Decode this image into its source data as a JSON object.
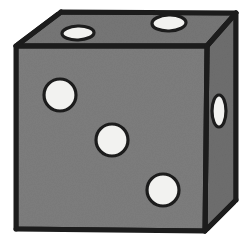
{
  "image": {
    "title": "Six-sided die shown in three-quarter perspective",
    "subject": "dice",
    "background_color": "#ffffff",
    "width": 246,
    "height": 246
  },
  "colors": {
    "outline": "#1c1c1c",
    "front_face_fill": "#7d7d7d",
    "top_face_fill": "#767676",
    "right_face_fill": "#6e6e6e",
    "pip_fill": "#f2f2f0",
    "pip_outline": "#1c1c1c"
  },
  "cube": {
    "faces": [
      {
        "name": "front-face",
        "label": "Front face",
        "pip_count": 3,
        "fill": "#7d7d7d",
        "polygon": "16,46 207,46 205,231 16,229"
      },
      {
        "name": "top-face",
        "label": "Top face",
        "pip_count": 2,
        "fill": "#767676",
        "polygon": "16,46 61,12 236,13 207,46"
      },
      {
        "name": "right-face",
        "label": "Right face",
        "pip_count": 1,
        "fill": "#6e6e6e",
        "polygon": "207,46 236,13 236,200 205,231"
      }
    ],
    "edges": [
      {
        "name": "edge-front-top",
        "from": "16,46",
        "to": "207,46"
      },
      {
        "name": "edge-front-right",
        "from": "207,46",
        "to": "205,231"
      },
      {
        "name": "edge-top-left",
        "from": "16,46",
        "to": "61,12"
      },
      {
        "name": "edge-top-back",
        "from": "61,12",
        "to": "236,13"
      },
      {
        "name": "edge-top-right",
        "from": "236,13",
        "to": "207,46"
      },
      {
        "name": "edge-right-back",
        "from": "236,13",
        "to": "236,200"
      },
      {
        "name": "edge-right-bottom",
        "from": "236,200",
        "to": "205,231"
      },
      {
        "name": "edge-front-bottom",
        "from": "16,229",
        "to": "205,231"
      },
      {
        "name": "edge-front-left",
        "from": "16,46",
        "to": "16,229"
      }
    ],
    "pips": [
      {
        "name": "pip-front-top-left",
        "face": "front-face",
        "cx": 60,
        "cy": 95,
        "rx": 16,
        "ry": 16,
        "rotate": 0
      },
      {
        "name": "pip-front-center",
        "face": "front-face",
        "cx": 112,
        "cy": 140,
        "rx": 16,
        "ry": 16,
        "rotate": 0
      },
      {
        "name": "pip-front-bottom-right",
        "face": "front-face",
        "cx": 163,
        "cy": 190,
        "rx": 16,
        "ry": 16,
        "rotate": 0
      },
      {
        "name": "pip-top-left",
        "face": "top-face",
        "cx": 78,
        "cy": 33,
        "rx": 16,
        "ry": 7,
        "rotate": -2
      },
      {
        "name": "pip-top-right",
        "face": "top-face",
        "cx": 169,
        "cy": 23,
        "rx": 17,
        "ry": 8,
        "rotate": -2
      },
      {
        "name": "pip-right-middle",
        "face": "right-face",
        "cx": 219,
        "cy": 111,
        "rx": 7,
        "ry": 16,
        "rotate": 0
      }
    ],
    "total_visible_pips": 6,
    "face_values": {
      "front": 3,
      "top": 2,
      "right": 1
    }
  }
}
